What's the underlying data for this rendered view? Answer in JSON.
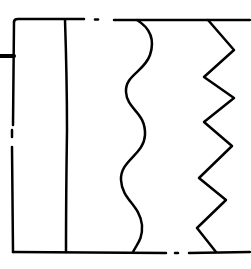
{
  "diagram": {
    "colors": {
      "background": "#ffffff",
      "stroke": "#000000"
    },
    "elements": [
      {
        "id": "left-stub",
        "kind": "horizontal tick"
      },
      {
        "id": "frame",
        "kind": "rectangle border with dashed gaps"
      },
      {
        "id": "straight-line",
        "kind": "straight vertical line"
      },
      {
        "id": "wavy-line",
        "kind": "wavy vertical line"
      },
      {
        "id": "zigzag-line",
        "kind": "zigzag vertical line"
      }
    ]
  }
}
